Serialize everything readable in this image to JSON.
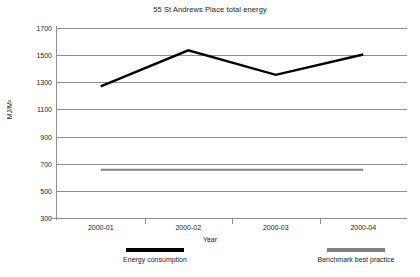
{
  "chart_data": {
    "type": "line",
    "title": "55 St Andrews Place total energy",
    "xlabel": "Year",
    "ylabel": "MJ/M²",
    "categories": [
      "2000-01",
      "2000-02",
      "2000-03",
      "2000-04"
    ],
    "ylim": [
      300,
      1700
    ],
    "yticks": [
      1700,
      1500,
      1300,
      1100,
      900,
      700,
      500,
      300
    ],
    "grid": true,
    "legend_position": "bottom",
    "series": [
      {
        "name": "Energy consumption",
        "color": "#000000",
        "style": "line",
        "values": [
          1270,
          1535,
          1355,
          1505
        ]
      },
      {
        "name": "Benchmark best practice",
        "color": "#808080",
        "style": "line",
        "values": [
          655,
          655,
          655,
          655
        ]
      }
    ]
  },
  "legend": {
    "entries": [
      {
        "label": "Energy consumption",
        "color": "#000000"
      },
      {
        "label": "Benchmark best practice",
        "color": "#808080"
      }
    ]
  }
}
